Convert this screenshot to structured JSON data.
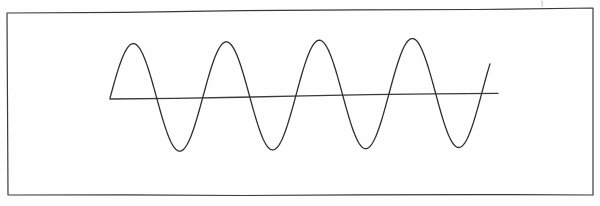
{
  "figure": {
    "title": "",
    "caption": "",
    "style": "hand-drawn-sketch",
    "background_color": "#fefefe",
    "ink_color": "#2e2e2e",
    "border": {
      "name": "frame-rectangle",
      "stroke_color": "#3a3a3a",
      "stroke_width": 1.2,
      "corners": {
        "top_left": [
          7,
          13
        ],
        "top_right": [
          593,
          8
        ],
        "bottom_right": [
          593,
          195
        ],
        "bottom_left": [
          8,
          195
        ]
      }
    },
    "tick_mark": {
      "name": "stray-tick-mark",
      "x": 542,
      "y_start": 1,
      "y_end": 6,
      "stroke_color": "#b8b8b8"
    }
  },
  "chart_data": {
    "type": "line",
    "title": "",
    "subtitle": "",
    "xlabel": "",
    "ylabel": "",
    "grid": false,
    "legend": null,
    "annotations": [],
    "axis": {
      "name": "horizontal-axis-line",
      "x_start": 110,
      "y_start": 99,
      "x_end": 498,
      "y_end": 93,
      "stroke_color": "#3a3a3a",
      "stroke_width": 1.3
    },
    "series": [
      {
        "name": "sine-wave",
        "stroke_color": "#2e2e2e",
        "stroke_width": 1.3,
        "description": "sinusoid, 4 full cycles",
        "cycles": 4,
        "amplitude_px": 54,
        "period_px": 93,
        "phase": "starts at baseline rising",
        "x_domain": [
          110,
          490
        ],
        "baseline_y": 98,
        "peaks_x": [
          133,
          228,
          321,
          415
        ],
        "peaks_y": [
          44,
          42,
          42,
          40
        ],
        "troughs_x": [
          182,
          275,
          368,
          463
        ],
        "troughs_y": [
          156,
          155,
          153,
          152
        ],
        "zero_crossings_x": [
          110,
          157,
          205,
          251,
          298,
          344,
          391,
          438,
          490
        ]
      }
    ]
  }
}
